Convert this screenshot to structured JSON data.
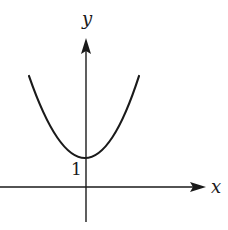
{
  "diagram": {
    "type": "function-graph",
    "axes": {
      "x_label": "x",
      "y_label": "y"
    },
    "annotations": {
      "y_intercept_label": "1"
    },
    "curve": {
      "shape": "parabola",
      "opens": "up",
      "vertex": [
        0,
        1
      ]
    },
    "colors": {
      "ink": "#1a1a1a",
      "background": "#ffffff"
    }
  }
}
